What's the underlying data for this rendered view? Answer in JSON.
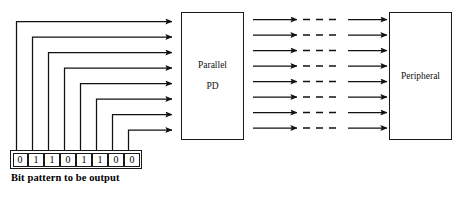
{
  "diagram": {
    "stroke_color": "#1a1a1a",
    "background_color": "#ffffff"
  },
  "pd_box": {
    "line1": "Parallel",
    "line2": "PD"
  },
  "peripheral_box": {
    "label": "Peripheral"
  },
  "bit_register": {
    "caption": "Bit pattern to be output",
    "bits": [
      "0",
      "1",
      "1",
      "0",
      "1",
      "1",
      "0",
      "0"
    ]
  },
  "connections": {
    "input_lane_count": 8,
    "output_lane_count": 8,
    "output_dash_count": 3
  }
}
